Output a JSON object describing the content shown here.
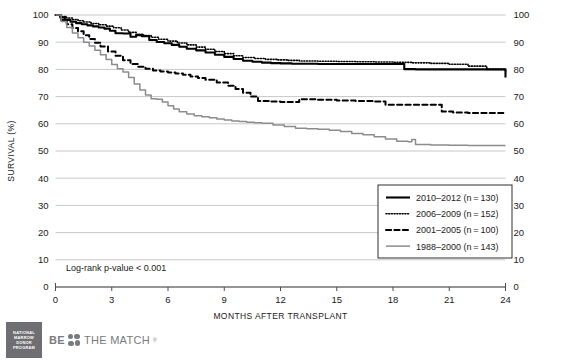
{
  "chart_data": {
    "type": "line",
    "title": "",
    "xlabel": "MONTHS AFTER TRANSPLANT",
    "ylabel": "SURVIVAL (%)",
    "xlim": [
      0,
      24
    ],
    "ylim": [
      0,
      100
    ],
    "xticks": [
      0,
      3,
      6,
      9,
      12,
      15,
      18,
      21,
      24
    ],
    "yticks": [
      0,
      10,
      20,
      30,
      40,
      50,
      60,
      70,
      80,
      90,
      100
    ],
    "grid": "horizontal",
    "right_axis_mirrored": true,
    "annotation": "Log-rank p-value < 0.001",
    "legend_position": "inside-lower-right",
    "series": [
      {
        "name": "2010–2012 (n = 130)",
        "label": "2010–2012",
        "n": 130,
        "style": "solid",
        "color": "#000000",
        "width": 2.1,
        "x": [
          0,
          0.25,
          0.5,
          0.8,
          1.1,
          1.4,
          1.7,
          2.0,
          2.3,
          2.6,
          2.9,
          3.2,
          3.6,
          4.0,
          4.3,
          4.6,
          5.0,
          5.4,
          5.8,
          6.2,
          6.6,
          7.0,
          7.5,
          8.0,
          8.5,
          9.0,
          9.5,
          10.0,
          10.5,
          11.0,
          11.5,
          12.0,
          12.6,
          13.2,
          14.0,
          15.0,
          16.0,
          17.0,
          18.0,
          18.6,
          19.2,
          20.0,
          21.0,
          22.0,
          23.0,
          24.0
        ],
        "y": [
          100,
          99.1,
          98.2,
          97.5,
          97.0,
          96.6,
          96.2,
          95.8,
          95.4,
          95.0,
          94.2,
          93.3,
          93.2,
          92.0,
          92.6,
          92.2,
          90.8,
          90.1,
          89.6,
          89.0,
          88.3,
          87.6,
          87.0,
          86.2,
          85.4,
          84.6,
          83.8,
          83.2,
          82.8,
          82.5,
          82.3,
          82.2,
          82.1,
          82.1,
          82.0,
          82.0,
          82.0,
          82.0,
          82.0,
          80.1,
          80.0,
          80.0,
          80.0,
          80.0,
          80.0,
          77.0
        ]
      },
      {
        "name": "2006–2009 (n = 152)",
        "label": "2006–2009",
        "n": 152,
        "style": "dotted",
        "color": "#000000",
        "width": 1.6,
        "x": [
          0,
          0.3,
          0.6,
          0.9,
          1.2,
          1.5,
          1.9,
          2.3,
          2.7,
          3.1,
          3.5,
          3.9,
          4.3,
          4.7,
          5.1,
          5.5,
          6.0,
          6.5,
          7.0,
          7.5,
          8.0,
          8.5,
          9.0,
          9.5,
          10.0,
          10.6,
          11.2,
          11.8,
          12.4,
          13.0,
          14.0,
          15.0,
          16.0,
          17.0,
          18.0,
          19.0,
          20.0,
          21.0,
          22.0,
          23.0,
          24.0
        ],
        "y": [
          100,
          99.4,
          98.9,
          98.3,
          97.9,
          97.4,
          96.9,
          96.4,
          95.9,
          95.3,
          94.5,
          93.6,
          92.9,
          92.4,
          91.8,
          91.1,
          90.4,
          89.7,
          89.0,
          88.2,
          87.4,
          86.6,
          85.8,
          85.0,
          84.4,
          84.0,
          83.7,
          83.5,
          83.3,
          83.1,
          83.0,
          82.9,
          82.8,
          82.7,
          82.6,
          82.4,
          82.2,
          81.9,
          81.2,
          80.0,
          79.2
        ]
      },
      {
        "name": "2001–2005 (n = 100)",
        "label": "2001–2005",
        "n": 100,
        "style": "dashed",
        "color": "#000000",
        "width": 2.0,
        "x": [
          0,
          0.3,
          0.6,
          0.9,
          1.2,
          1.5,
          1.8,
          2.1,
          2.4,
          2.8,
          3.2,
          3.6,
          4.0,
          4.4,
          4.8,
          5.2,
          5.6,
          6.0,
          6.4,
          6.8,
          7.2,
          7.6,
          8.0,
          8.6,
          9.2,
          9.6,
          10.0,
          10.4,
          10.8,
          11.4,
          12.0,
          13.0,
          14.0,
          15.0,
          16.0,
          17.0,
          17.6,
          18.2,
          19.0,
          20.0,
          20.6,
          21.2,
          22.0,
          23.0,
          24.0
        ],
        "y": [
          100,
          98.2,
          96.6,
          95.2,
          94.0,
          92.6,
          91.2,
          89.8,
          88.4,
          86.6,
          85.0,
          83.4,
          82.0,
          81.0,
          80.2,
          79.6,
          79.2,
          78.9,
          78.5,
          78.0,
          77.4,
          76.8,
          76.2,
          75.2,
          74.0,
          72.8,
          71.4,
          70.0,
          68.4,
          68.2,
          68.0,
          69.0,
          68.8,
          68.6,
          68.4,
          68.2,
          67.0,
          67.0,
          67.0,
          67.0,
          64.5,
          64.2,
          64.0,
          64.0,
          64.0
        ]
      },
      {
        "name": "1988–2000 (n = 143)",
        "label": "1988–2000",
        "n": 143,
        "style": "solid",
        "color": "#8c8c90",
        "width": 1.5,
        "x": [
          0,
          0.3,
          0.6,
          0.9,
          1.2,
          1.5,
          1.8,
          2.1,
          2.4,
          2.7,
          3.0,
          3.3,
          3.6,
          3.9,
          4.2,
          4.5,
          4.8,
          5.1,
          5.4,
          5.7,
          6.0,
          6.3,
          6.6,
          7.0,
          7.4,
          7.8,
          8.2,
          8.6,
          9.0,
          9.4,
          9.8,
          10.2,
          10.6,
          11.0,
          11.6,
          12.2,
          12.8,
          13.4,
          14.0,
          14.6,
          15.2,
          15.8,
          16.4,
          17.0,
          17.6,
          18.2,
          18.8,
          19.0,
          19.2,
          20.0,
          21.0,
          22.0,
          23.0,
          24.0
        ],
        "y": [
          100,
          97.6,
          95.4,
          93.4,
          91.6,
          90.0,
          88.6,
          87.0,
          85.4,
          83.6,
          81.8,
          80.2,
          79.0,
          77.0,
          74.6,
          72.4,
          70.6,
          69.2,
          69.0,
          68.0,
          66.6,
          65.4,
          64.4,
          63.6,
          63.0,
          62.6,
          62.2,
          61.8,
          61.4,
          61.0,
          60.8,
          60.6,
          60.4,
          60.2,
          59.6,
          59.0,
          58.4,
          58.2,
          58.0,
          57.6,
          57.2,
          56.4,
          56.0,
          55.2,
          54.4,
          53.6,
          53.4,
          54.2,
          52.4,
          52.2,
          52.1,
          52.0,
          52.0,
          52.0
        ]
      }
    ]
  },
  "brand": {
    "nmdp_lines": [
      "NATIONAL",
      "MARROW",
      "DONOR",
      "PROGRAM"
    ],
    "be_word": "BE",
    "the_match_word": "THE MATCH",
    "trademark": "®"
  },
  "colors": {
    "grid": "#b9b9bd",
    "axis": "#4d4d4d",
    "series_primary": "#000000",
    "series_gray": "#8c8c90",
    "brand_gray": "#7a7a7e",
    "logo_box": "#6f6f73"
  }
}
